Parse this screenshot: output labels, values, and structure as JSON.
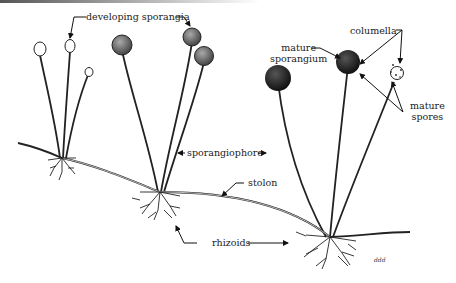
{
  "diagram": {
    "labels": {
      "developing_sporangia": "developing sporangia",
      "mature_sporangium_1": "mature",
      "mature_sporangium_2": "sporangium",
      "columella": "columella",
      "mature_spores_1": "mature",
      "mature_spores_2": "spores",
      "sporangiophore": "sporangiophore",
      "stolon": "stolon",
      "rhizoids": "rhizoids",
      "signature": "ddd"
    }
  }
}
